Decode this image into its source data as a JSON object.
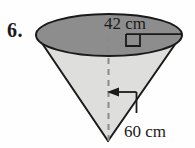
{
  "figure": {
    "problem_number": "6.",
    "shape": "cone",
    "orientation": "inverted",
    "labels": {
      "diameter": "42 cm",
      "slant_height": "60 cm"
    },
    "markers": {
      "right_angle": "right-angle-square",
      "axis": "dashed-vertical-axis",
      "pointer": "left-arrow"
    },
    "colors": {
      "background": "#fefefe",
      "ellipse_fill": "#8d8d8d",
      "cone_fill": "#dededc",
      "outline": "#1a1a1a",
      "text": "#1a1a1a",
      "dash": "#8a8a8a"
    },
    "geometry": {
      "ellipse_center_x": 109,
      "ellipse_center_y": 35,
      "ellipse_rx": 73,
      "ellipse_ry": 21,
      "apex_x": 108,
      "apex_y": 141
    }
  }
}
